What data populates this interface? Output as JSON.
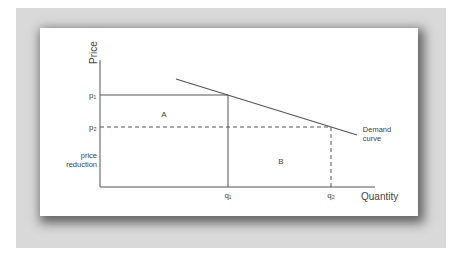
{
  "figure": {
    "y_axis_label": "Price",
    "x_axis_label": "Quantity",
    "price_labels": {
      "p1": "p₁",
      "p2": "p₂"
    },
    "quantity_labels": {
      "q1": "q₁",
      "q2": "q₂"
    },
    "region_a": "A",
    "region_b": "B",
    "price_reduction_line1": "price",
    "price_reduction_line2": "reduction",
    "demand_line1": "Demand",
    "demand_line2": "curve"
  },
  "colors": {
    "background": "#d9d9d9",
    "card": "#ffffff",
    "line": "#555555",
    "text": "#444444"
  }
}
